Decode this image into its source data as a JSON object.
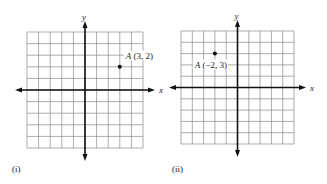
{
  "panels": [
    {
      "caption": "(i)",
      "x_axis_label": "x",
      "y_axis_label": "y",
      "grid": {
        "cols": 10,
        "rows": 10,
        "x_range": [
          -5,
          5
        ],
        "y_range": [
          -5,
          5
        ]
      },
      "point": {
        "name": "A",
        "coords": "(3, 2)",
        "x": 3,
        "y": 2
      }
    },
    {
      "caption": "(ii)",
      "x_axis_label": "x",
      "y_axis_label": "y",
      "grid": {
        "cols": 10,
        "rows": 10,
        "x_range": [
          -5,
          5
        ],
        "y_range": [
          -5,
          5
        ]
      },
      "point": {
        "name": "A",
        "coords": "(−2, 3)",
        "x": -2,
        "y": 3
      }
    }
  ],
  "colors": {
    "grid": "#8a8a8a",
    "axis": "#111111",
    "point": "#111111"
  }
}
